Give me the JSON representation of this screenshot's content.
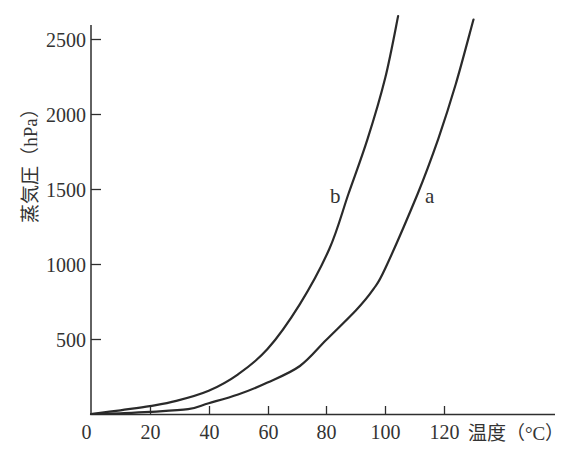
{
  "chart_data": {
    "type": "line",
    "title": "",
    "xlabel": "温度（°C）",
    "ylabel": "蒸気圧（hPa）",
    "xlim": [
      0,
      150
    ],
    "ylim": [
      0,
      2600
    ],
    "x_ticks": [
      0,
      20,
      40,
      60,
      80,
      100,
      120
    ],
    "y_ticks": [
      500,
      1000,
      1500,
      2000,
      2500
    ],
    "grid": false,
    "legend": "none — curves labeled inline",
    "series": [
      {
        "name": "a",
        "label_at": [
          113.5,
          1407
        ],
        "x": [
          0,
          10,
          20,
          33,
          40,
          50,
          60,
          71,
          80,
          90,
          96,
          100,
          111,
          118,
          124,
          130
        ],
        "values": [
          0,
          5,
          14,
          32,
          72,
          130,
          210,
          320,
          495,
          690,
          833,
          970,
          1467,
          1833,
          2200,
          2630
        ]
      },
      {
        "name": "b",
        "label_at": [
          81.2,
          1407
        ],
        "x": [
          0,
          10,
          20,
          29,
          40,
          50,
          60,
          71,
          81,
          87.5,
          94,
          100,
          104.4
        ],
        "values": [
          0,
          25,
          53,
          87,
          155,
          265,
          433,
          733,
          1100,
          1467,
          1833,
          2240,
          2653
        ]
      }
    ]
  }
}
